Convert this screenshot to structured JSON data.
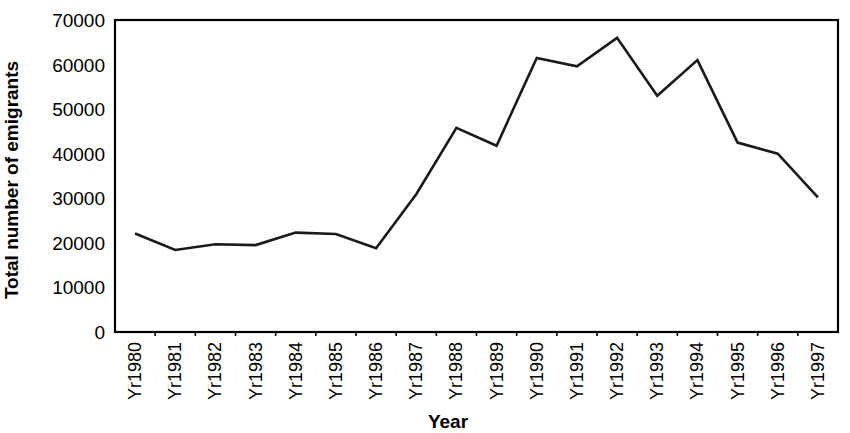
{
  "chart_data": {
    "type": "line",
    "title": "",
    "xlabel": "Year",
    "ylabel": "Total number of emigrants",
    "categories": [
      "Yr1980",
      "Yr1981",
      "Yr1982",
      "Yr1983",
      "Yr1984",
      "Yr1985",
      "Yr1986",
      "Yr1987",
      "Yr1988",
      "Yr1989",
      "Yr1990",
      "Yr1991",
      "Yr1992",
      "Yr1993",
      "Yr1994",
      "Yr1995",
      "Yr1996",
      "Yr1997"
    ],
    "values": [
      22100,
      18400,
      19700,
      19500,
      22300,
      22000,
      18800,
      30900,
      45800,
      41800,
      61500,
      59600,
      66000,
      53000,
      61000,
      42500,
      40000,
      30200
    ],
    "series": [
      {
        "name": "Total number of emigrants",
        "values": [
          22100,
          18400,
          19700,
          19500,
          22300,
          22000,
          18800,
          30900,
          45800,
          41800,
          61500,
          59600,
          66000,
          53000,
          61000,
          42500,
          40000,
          30200
        ]
      }
    ],
    "ylim": [
      0,
      70000
    ],
    "ytick_values": [
      0,
      10000,
      20000,
      30000,
      40000,
      50000,
      60000,
      70000
    ],
    "ytick_labels": [
      "0",
      "10000",
      "20000",
      "30000",
      "40000",
      "50000",
      "60000",
      "70000"
    ],
    "grid": false,
    "legend": false,
    "legend_position": "none",
    "line_color": "#1a1a1a",
    "xtick_rotation": -90
  },
  "axes": {
    "y_axis_title": "Total number of emigrants",
    "x_axis_title": "Year"
  }
}
